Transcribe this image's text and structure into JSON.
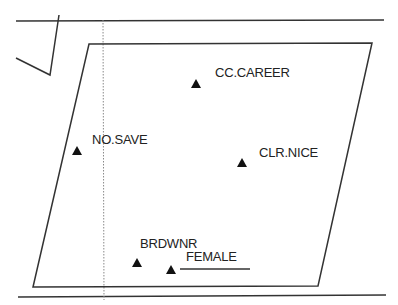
{
  "diagram": {
    "colors": {
      "line": "#333333",
      "marker": "#111111",
      "dotted": "#888888",
      "background": "#ffffff"
    },
    "points": [
      {
        "id": "cc-career",
        "label": "CC.CAREER",
        "marker": "triangle"
      },
      {
        "id": "no-save",
        "label": "NO.SAVE",
        "marker": "triangle"
      },
      {
        "id": "clr-nice",
        "label": "CLR.NICE",
        "marker": "triangle"
      },
      {
        "id": "brdwnr",
        "label": "BRDWNR",
        "marker": "triangle"
      },
      {
        "id": "female",
        "label": "FEMALE",
        "marker": "triangle"
      }
    ]
  }
}
